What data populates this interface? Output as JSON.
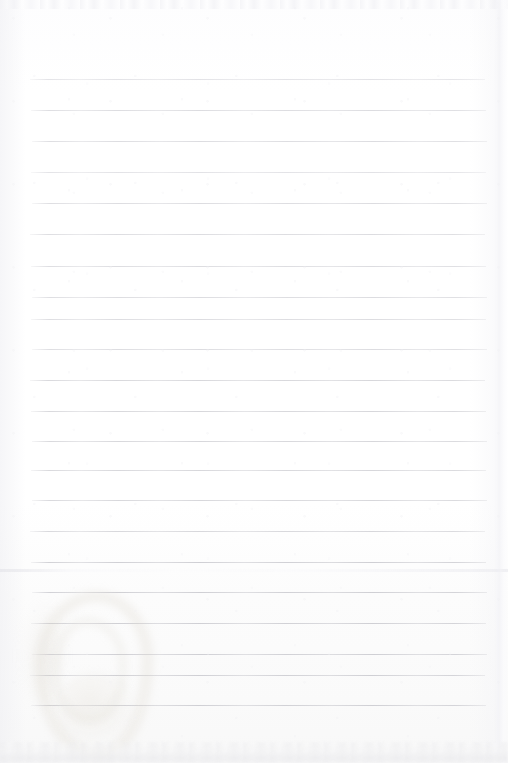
{
  "page": {
    "kind": "scanned-ruled-notebook-page",
    "width": 508,
    "height": 763,
    "background_color": "#fefefe",
    "content_text": "",
    "handwriting_present": "no",
    "printed_text_present": "no"
  },
  "ruling": {
    "line_color": "#d7d7db",
    "line_thickness_px": 1,
    "line_left_px": 31,
    "line_right_px": 486,
    "first_line_y_px": 79,
    "line_spacing_px": 31.3,
    "line_count": 21,
    "lines": [
      {
        "y": 79,
        "weight": "faintest"
      },
      {
        "y": 110,
        "weight": "faint"
      },
      {
        "y": 141,
        "weight": "faint"
      },
      {
        "y": 172,
        "weight": "faintest"
      },
      {
        "y": 203,
        "weight": "faint"
      },
      {
        "y": 234,
        "weight": "faint"
      },
      {
        "y": 266,
        "weight": "faint"
      },
      {
        "y": 297,
        "weight": "faint"
      },
      {
        "y": 319,
        "weight": "faint"
      },
      {
        "y": 349,
        "weight": "faint"
      },
      {
        "y": 380,
        "weight": "normal"
      },
      {
        "y": 411,
        "weight": "normal"
      },
      {
        "y": 441,
        "weight": "normal"
      },
      {
        "y": 470,
        "weight": "normal"
      },
      {
        "y": 500,
        "weight": "normal"
      },
      {
        "y": 531,
        "weight": "normal"
      },
      {
        "y": 562,
        "weight": "strong"
      },
      {
        "y": 592,
        "weight": "strong"
      },
      {
        "y": 623,
        "weight": "strong"
      },
      {
        "y": 654,
        "weight": "strong"
      },
      {
        "y": 675,
        "weight": "strong"
      },
      {
        "y": 705,
        "weight": "strong"
      }
    ]
  },
  "artifacts": {
    "top_noise_band": {
      "label": "scanner edge noise band",
      "y": 0,
      "height": 9
    },
    "fold_crease": {
      "label": "horizontal fold crease",
      "y": 569,
      "color": "#e8e8ec"
    },
    "right_seam": {
      "label": "vertical page seam near right edge",
      "x": 497,
      "color": "#eeeef2"
    },
    "stain": {
      "label": "faint tan ring-shaped stain",
      "color": "#ded8cc",
      "x": 36,
      "y": 592,
      "width": 98,
      "height": 150
    },
    "bottom_smudge": {
      "label": "smudged bottom edge band",
      "y": 742,
      "height": 21,
      "color": "#ececee"
    }
  }
}
